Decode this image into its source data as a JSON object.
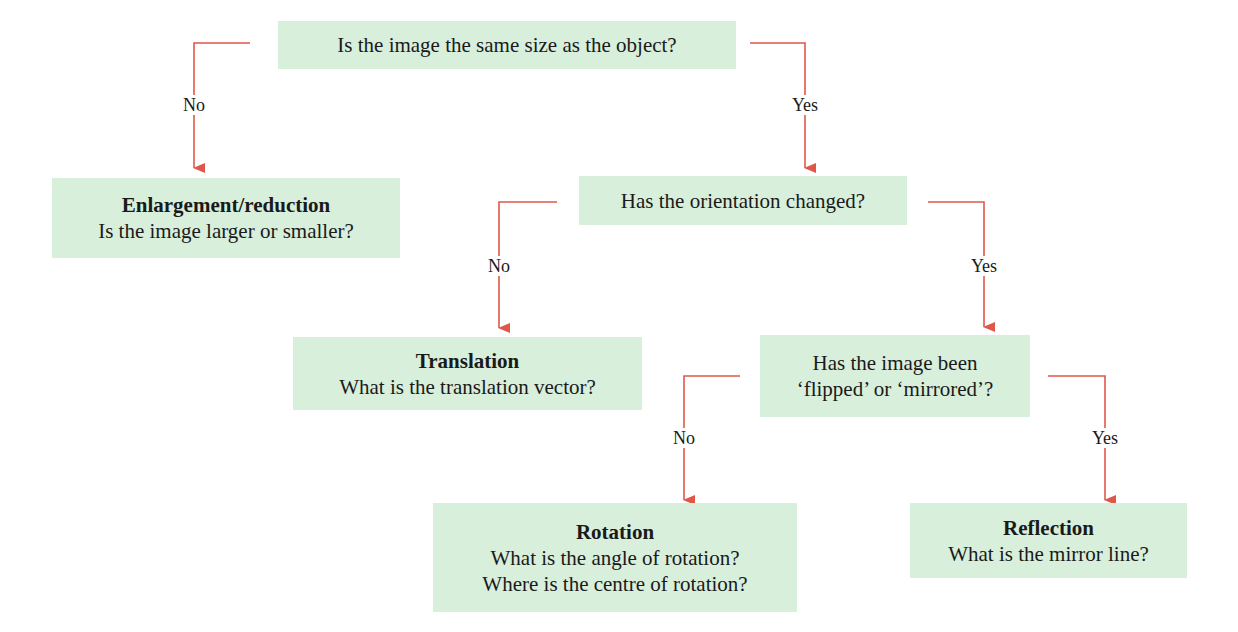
{
  "colors": {
    "box_fill": "#d8efdc",
    "connector": "#e0574a",
    "text": "#1a1a1a"
  },
  "nodes": {
    "same_size": {
      "text": "Is the image the same size as the object?"
    },
    "enlargement": {
      "title": "Enlargement/reduction",
      "question": "Is the image larger or smaller?"
    },
    "orientation": {
      "text": "Has the orientation changed?"
    },
    "translation": {
      "title": "Translation",
      "question": "What is the translation vector?"
    },
    "flipped": {
      "line1": "Has the image been",
      "line2": "‘flipped’ or ‘mirrored’?"
    },
    "rotation": {
      "title": "Rotation",
      "question1": "What is the angle of rotation?",
      "question2": "Where is the centre of rotation?"
    },
    "reflection": {
      "title": "Reflection",
      "question": "What is the mirror line?"
    }
  },
  "edges": {
    "same_size_no": "No",
    "same_size_yes": "Yes",
    "orientation_no": "No",
    "orientation_yes": "Yes",
    "flipped_no": "No",
    "flipped_yes": "Yes"
  }
}
